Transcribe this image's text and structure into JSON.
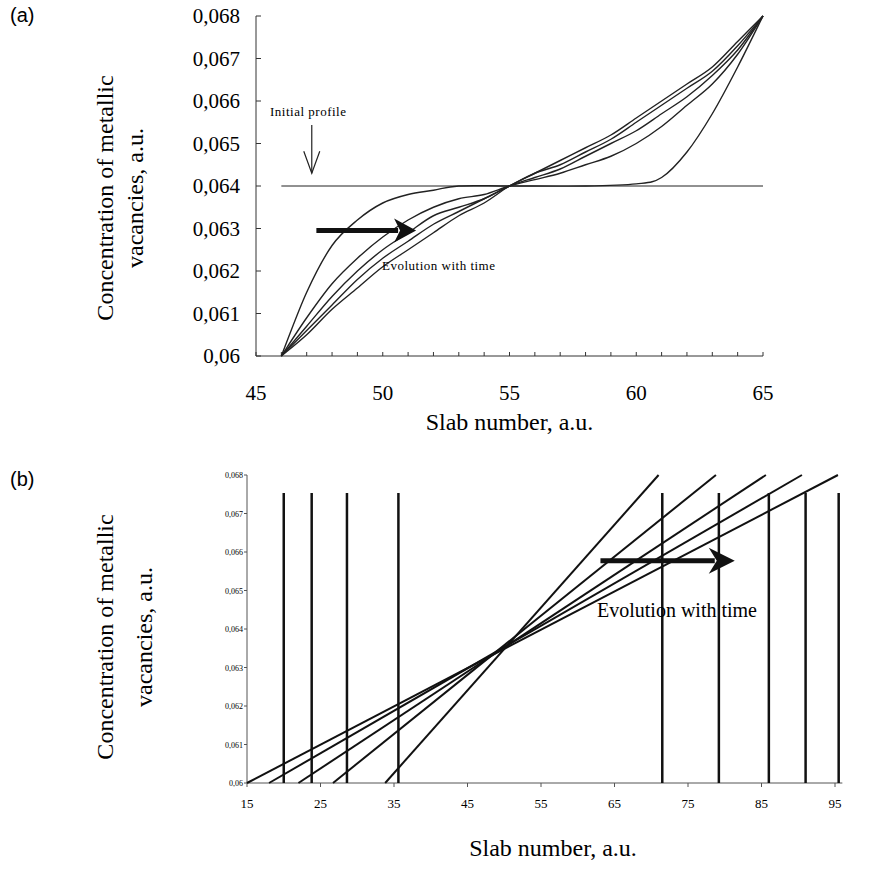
{
  "panels": {
    "a": {
      "label": "(a)"
    },
    "b": {
      "label": "(b)"
    }
  },
  "chart_data": [
    {
      "id": "a",
      "type": "line",
      "title": "",
      "xlabel": "Slab number, a.u.",
      "ylabel_lines": [
        "Concentration of metallic",
        "vacancies, a.u."
      ],
      "xlim": [
        45,
        65
      ],
      "ylim": [
        0.06,
        0.068
      ],
      "x_ticks": [
        45,
        50,
        55,
        60,
        65
      ],
      "x_tick_labels": [
        "45",
        "50",
        "55",
        "60",
        "65"
      ],
      "x_minor_step": 1,
      "y_ticks": [
        0.06,
        0.061,
        0.062,
        0.063,
        0.064,
        0.065,
        0.066,
        0.067,
        0.068
      ],
      "y_tick_labels": [
        "0,06",
        "0,061",
        "0,062",
        "0,063",
        "0,064",
        "0,065",
        "0,066",
        "0,067",
        "0,068"
      ],
      "grid": false,
      "annotations": [
        {
          "text": "Initial profile",
          "arrow": "down",
          "points_to": [
            47.2,
            0.0643
          ]
        },
        {
          "text": "Evolution with time",
          "arrow": "right",
          "from": [
            47.5,
            0.063
          ],
          "to": [
            51,
            0.063
          ]
        }
      ],
      "series": [
        {
          "name": "Initial profile",
          "x": [
            46,
            65
          ],
          "y": [
            0.064,
            0.064
          ]
        },
        {
          "name": "t1",
          "x": [
            46,
            47,
            48,
            49,
            50,
            51,
            52,
            53,
            55,
            58,
            60,
            61,
            62,
            63,
            64,
            65
          ],
          "y": [
            0.06,
            0.0615,
            0.0626,
            0.0632,
            0.0636,
            0.0638,
            0.0639,
            0.064,
            0.064,
            0.064,
            0.06405,
            0.0642,
            0.0648,
            0.0657,
            0.0668,
            0.068
          ]
        },
        {
          "name": "t2",
          "x": [
            46,
            47,
            48,
            49,
            50,
            51,
            52,
            53,
            54,
            55,
            56,
            57,
            58,
            59,
            60,
            61,
            62,
            63,
            64,
            65
          ],
          "y": [
            0.06,
            0.0609,
            0.0617,
            0.0623,
            0.0628,
            0.0632,
            0.0635,
            0.0637,
            0.0638,
            0.064,
            0.06415,
            0.0643,
            0.0645,
            0.0647,
            0.065,
            0.0654,
            0.0659,
            0.0664,
            0.0671,
            0.068
          ]
        },
        {
          "name": "t3",
          "x": [
            46,
            47,
            48,
            49,
            50,
            51,
            52,
            53,
            54,
            55,
            56,
            57,
            58,
            59,
            60,
            61,
            62,
            63,
            64,
            65
          ],
          "y": [
            0.06,
            0.0607,
            0.0614,
            0.062,
            0.0625,
            0.0629,
            0.0633,
            0.0635,
            0.0637,
            0.064,
            0.0642,
            0.0644,
            0.0647,
            0.065,
            0.0653,
            0.0657,
            0.0661,
            0.0666,
            0.0672,
            0.068
          ]
        },
        {
          "name": "t4",
          "x": [
            46,
            47,
            48,
            49,
            50,
            51,
            52,
            53,
            54,
            55,
            56,
            57,
            58,
            59,
            60,
            61,
            62,
            63,
            64,
            65
          ],
          "y": [
            0.06,
            0.0606,
            0.0612,
            0.0618,
            0.0623,
            0.0627,
            0.0631,
            0.0634,
            0.0637,
            0.064,
            0.0643,
            0.0645,
            0.0648,
            0.0651,
            0.0655,
            0.0659,
            0.0663,
            0.0667,
            0.0673,
            0.068
          ]
        },
        {
          "name": "t5",
          "x": [
            46,
            47,
            48,
            49,
            50,
            51,
            52,
            53,
            54,
            55,
            56,
            57,
            58,
            59,
            60,
            61,
            62,
            63,
            64,
            65
          ],
          "y": [
            0.06,
            0.0605,
            0.0611,
            0.0616,
            0.0621,
            0.0625,
            0.0629,
            0.0633,
            0.0636,
            0.064,
            0.0643,
            0.0646,
            0.0649,
            0.0652,
            0.0656,
            0.066,
            0.0664,
            0.0668,
            0.0674,
            0.068
          ]
        }
      ]
    },
    {
      "id": "b",
      "type": "line",
      "title": "",
      "xlabel": "Slab number, a.u.",
      "ylabel_lines": [
        "Concentration of metallic",
        "vacancies, a.u."
      ],
      "xlim": [
        15,
        96
      ],
      "ylim": [
        0.06,
        0.068
      ],
      "x_ticks": [
        15,
        25,
        35,
        45,
        55,
        65,
        75,
        85,
        95
      ],
      "x_tick_labels": [
        "15",
        "25",
        "35",
        "45",
        "55",
        "65",
        "75",
        "85",
        "95"
      ],
      "y_ticks": [
        0.06,
        0.061,
        0.062,
        0.063,
        0.064,
        0.065,
        0.066,
        0.067,
        0.068
      ],
      "y_tick_labels": [
        "0,06",
        "0,061",
        "0,062",
        "0,063",
        "0,064",
        "0,065",
        "0,066",
        "0,067",
        "0,068"
      ],
      "grid": false,
      "annotations": [
        {
          "text": "Evolution with time",
          "arrow": "right",
          "from": [
            62,
            0.0658
          ],
          "to": [
            80,
            0.0658
          ]
        }
      ],
      "series": [
        {
          "name": "profile-1",
          "x": [
            33.8,
            71.0
          ],
          "y": [
            0.06,
            0.068
          ]
        },
        {
          "name": "profile-2",
          "x": [
            26.7,
            78.8
          ],
          "y": [
            0.06,
            0.068
          ]
        },
        {
          "name": "profile-3",
          "x": [
            22.0,
            85.6
          ],
          "y": [
            0.06,
            0.068
          ]
        },
        {
          "name": "profile-4",
          "x": [
            18.0,
            90.5
          ],
          "y": [
            0.06,
            0.068
          ]
        },
        {
          "name": "profile-5",
          "x": [
            15.0,
            95.4
          ],
          "y": [
            0.06,
            0.068
          ]
        }
      ],
      "boundaries": {
        "top": 0.06753,
        "bottom": 0.06,
        "x": [
          20.0,
          23.8,
          28.6,
          35.6,
          71.5,
          79.2,
          86.0,
          91.0,
          95.5
        ]
      }
    }
  ]
}
